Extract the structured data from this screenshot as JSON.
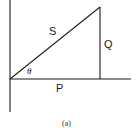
{
  "figure": {
    "caption": "(a)",
    "labels": {
      "hypotenuse": "S",
      "opposite": "Q",
      "adjacent": "P",
      "angle": "θ"
    },
    "stroke_color": "#1a1a1a"
  }
}
